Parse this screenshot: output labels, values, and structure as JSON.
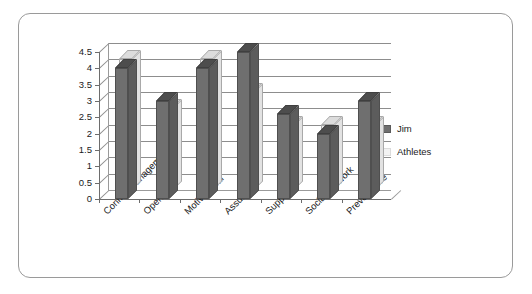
{
  "chart_data": {
    "type": "bar",
    "title": "",
    "subtitle": "",
    "xlabel": "",
    "ylabel": "",
    "ylim": [
      0,
      4.5
    ],
    "grid": true,
    "legend_position": "right",
    "style": "3d-clustered-column",
    "categories": [
      "Conflict management",
      "Openness",
      "Motivational",
      "Assurance",
      "Support",
      "Social Network",
      "Preventative"
    ],
    "ytick_labels": [
      "0",
      "0.5",
      "1",
      "1.5",
      "2",
      "2.5",
      "3",
      "3.5",
      "4",
      "4.5"
    ],
    "ytick_values": [
      0,
      0.5,
      1,
      1.5,
      2,
      2.5,
      3,
      3.5,
      4,
      4.5
    ],
    "series": [
      {
        "name": "Jim",
        "color": "#6f6f6f",
        "values": [
          4,
          3,
          4,
          4.5,
          2.6,
          2,
          3
        ]
      },
      {
        "name": "Athletes",
        "color": "#eeeeee",
        "values": [
          4,
          2.5,
          4,
          3,
          2,
          2,
          2
        ]
      }
    ]
  },
  "legend": {
    "items": [
      {
        "label": "Jim",
        "swatch": "jim"
      },
      {
        "label": "Athletes",
        "swatch": "ath"
      }
    ]
  }
}
